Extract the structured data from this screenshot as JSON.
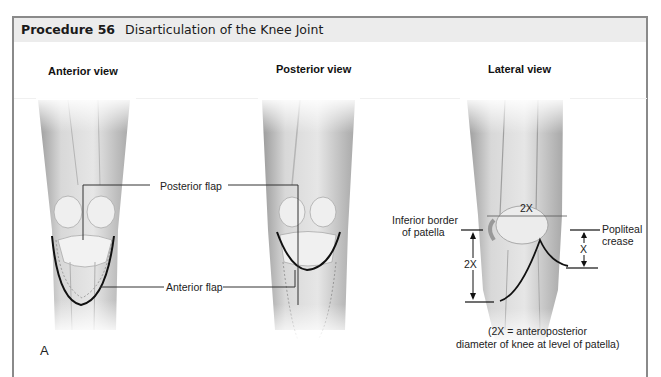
{
  "figure": {
    "procedure_label": "Procedure 56",
    "title": "Disarticulation of the Knee Joint",
    "panel_letter": "A",
    "views": [
      {
        "label": "Anterior view"
      },
      {
        "label": "Posterior view"
      },
      {
        "label": "Lateral view"
      }
    ],
    "callouts": {
      "posterior_flap": "Posterior flap",
      "anterior_flap": "Anterior flap",
      "inferior_border_line1": "Inferior border",
      "inferior_border_line2": "of patella",
      "popliteal_line1": "Popliteal",
      "popliteal_line2": "crease",
      "dim_2x_top": "2X",
      "dim_2x_left": "2X",
      "dim_x_right": "X"
    },
    "caption": {
      "line1": "(2X = anteroposterior",
      "line2": "diameter of knee at level of patella)"
    }
  }
}
